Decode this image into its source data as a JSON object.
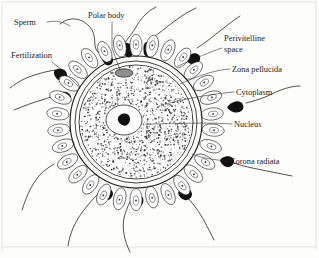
{
  "figure": {
    "background_color": "#fdfdfc",
    "ink_color": "#1d1d1d",
    "border_color": "#dedcd8"
  },
  "labels": [
    {
      "id": "sperm",
      "text": "Sperm",
      "x": 14,
      "y": 25,
      "align": "start"
    },
    {
      "id": "polar-body",
      "text": "Polar body",
      "x": 88,
      "y": 18,
      "align": "start"
    },
    {
      "id": "fertilization",
      "text": "Fertilization",
      "x": 11,
      "y": 58,
      "align": "start"
    },
    {
      "id": "perivitelline",
      "text": "Perivitelline",
      "x": 224,
      "y": 41,
      "align": "start"
    },
    {
      "id": "perivitelline-2",
      "text": "space",
      "x": 224,
      "y": 52,
      "align": "start"
    },
    {
      "id": "zona-pellucida",
      "text": "Zona pellucida",
      "x": 232,
      "y": 72,
      "align": "start"
    },
    {
      "id": "cytoplasm",
      "text": "Cytoplasm",
      "x": 236,
      "y": 95,
      "align": "start"
    },
    {
      "id": "nucleus",
      "text": "Nucleus",
      "x": 234,
      "y": 127,
      "align": "start"
    },
    {
      "id": "corona-radiata",
      "text": "Corona radiata",
      "x": 230,
      "y": 164,
      "align": "start"
    }
  ],
  "structures": [
    {
      "name": "zona-pellucida",
      "type": "ring",
      "label": "Zona pellucida"
    },
    {
      "name": "perivitelline-space",
      "type": "ring",
      "label": "Perivitelline space"
    },
    {
      "name": "cytoplasm",
      "type": "region",
      "label": "Cytoplasm"
    },
    {
      "name": "nucleus",
      "type": "oval",
      "label": "Nucleus"
    },
    {
      "name": "nucleolus",
      "type": "dot",
      "label": "Nucleolus"
    },
    {
      "name": "polar-body",
      "type": "oval",
      "label": "Polar body"
    },
    {
      "name": "corona-radiata",
      "type": "cell-ring",
      "label": "Corona radiata",
      "cell_count": 30
    },
    {
      "name": "sperm",
      "type": "cells",
      "label": "Sperm",
      "count": 12
    }
  ],
  "geometry": {
    "center_x": 136,
    "center_y": 122,
    "zona_outer_r": 66,
    "zona_inner_r": 61,
    "vitelline_r": 57,
    "corona_inner_r": 68,
    "corona_outer_r": 88,
    "nucleus_cx": 124,
    "nucleus_cy": 120,
    "nucleus_rx": 18,
    "nucleus_ry": 15
  }
}
